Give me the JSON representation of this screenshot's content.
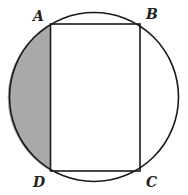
{
  "diagram": {
    "type": "geometry",
    "circle": {
      "center": [
        94,
        97
      ],
      "radius": 84.5,
      "stroke": "#1a1a1a"
    },
    "rectangle": {
      "vertices": {
        "A": [
          50.5,
          24
        ],
        "B": [
          140,
          24
        ],
        "C": [
          140,
          171
        ],
        "D": [
          50.5,
          171
        ]
      },
      "stroke": "#1a1a1a"
    },
    "shaded_region": {
      "bounded_by": "chord AD and minor arc AD",
      "fill": "#a9a9a9"
    },
    "labels": {
      "A": "A",
      "B": "B",
      "C": "C",
      "D": "D"
    }
  }
}
